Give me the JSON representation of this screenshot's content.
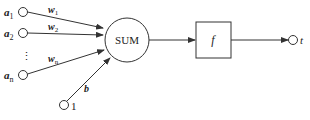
{
  "diagram": {
    "inputs": [
      {
        "name": "a",
        "sub": "1",
        "weight": "w",
        "weight_sub": "1"
      },
      {
        "name": "a",
        "sub": "2",
        "weight": "w",
        "weight_sub": "2"
      },
      {
        "name": "a",
        "sub": "n",
        "weight": "w",
        "weight_sub": "n"
      }
    ],
    "ellipsis": "⋮",
    "bias": {
      "label": "b",
      "input_value": "1"
    },
    "sum_label": "SUM",
    "transfer_label": "f",
    "output_label": "t"
  }
}
